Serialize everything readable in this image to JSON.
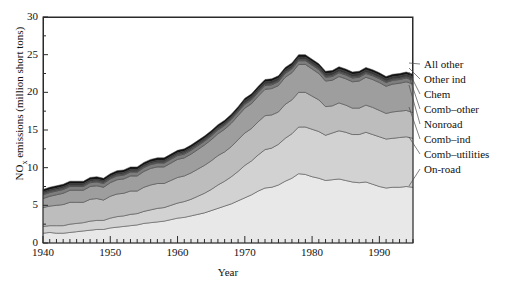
{
  "figure": {
    "xlabel": "Year",
    "ylabel_main": "NO",
    "ylabel_sub": "x",
    "ylabel_rest": " emissions (million short tons)"
  },
  "axes": {
    "y_ticks": [
      "0",
      "5",
      "10",
      "15",
      "20",
      "25",
      "30"
    ],
    "x_ticks": [
      "1940",
      "1950",
      "1960",
      "1970",
      "1980",
      "1990"
    ]
  },
  "legend": {
    "items": [
      {
        "label": "All other"
      },
      {
        "label": "Other ind"
      },
      {
        "label": "Chem"
      },
      {
        "label": "Comb–other"
      },
      {
        "label": "Nonroad"
      },
      {
        "label": "Comb–ind"
      },
      {
        "label": "Comb–utilities"
      },
      {
        "label": "On-road"
      }
    ]
  },
  "chart_data": {
    "type": "area",
    "title": "",
    "xlabel": "Year",
    "ylabel": "NOx emissions (million short tons)",
    "xlim": [
      1940,
      1995
    ],
    "ylim": [
      0,
      30
    ],
    "grid": false,
    "stacked": true,
    "legend_position": "right-outside-leader-lines",
    "x": [
      1940,
      1941,
      1942,
      1943,
      1944,
      1945,
      1946,
      1947,
      1948,
      1949,
      1950,
      1951,
      1952,
      1953,
      1954,
      1955,
      1956,
      1957,
      1958,
      1959,
      1960,
      1961,
      1962,
      1963,
      1964,
      1965,
      1966,
      1967,
      1968,
      1969,
      1970,
      1971,
      1972,
      1973,
      1974,
      1975,
      1976,
      1977,
      1978,
      1979,
      1980,
      1981,
      1982,
      1983,
      1984,
      1985,
      1986,
      1987,
      1988,
      1989,
      1990,
      1991,
      1992,
      1993,
      1994,
      1995
    ],
    "series": [
      {
        "name": "On-road",
        "color": "#e8e8e8",
        "values": [
          1.3,
          1.4,
          1.3,
          1.3,
          1.4,
          1.5,
          1.6,
          1.7,
          1.8,
          1.8,
          2.0,
          2.1,
          2.2,
          2.3,
          2.4,
          2.6,
          2.7,
          2.8,
          2.9,
          3.1,
          3.3,
          3.4,
          3.6,
          3.8,
          4.0,
          4.3,
          4.6,
          4.9,
          5.2,
          5.6,
          6.0,
          6.4,
          6.9,
          7.3,
          7.4,
          7.7,
          8.2,
          8.6,
          9.2,
          9.1,
          8.8,
          8.6,
          8.3,
          8.4,
          8.5,
          8.3,
          8.1,
          8.0,
          8.1,
          7.8,
          7.5,
          7.3,
          7.4,
          7.4,
          7.5,
          7.4
        ]
      },
      {
        "name": "Comb–utilities",
        "color": "#d2d2d2",
        "values": [
          0.9,
          0.9,
          1.0,
          1.0,
          1.1,
          1.1,
          1.1,
          1.2,
          1.2,
          1.2,
          1.3,
          1.4,
          1.4,
          1.5,
          1.5,
          1.6,
          1.7,
          1.8,
          1.8,
          1.9,
          2.0,
          2.1,
          2.2,
          2.4,
          2.6,
          2.8,
          3.1,
          3.3,
          3.6,
          3.9,
          4.3,
          4.5,
          4.8,
          5.1,
          5.2,
          5.4,
          5.7,
          5.9,
          6.2,
          6.3,
          6.3,
          6.2,
          6.0,
          6.2,
          6.4,
          6.4,
          6.3,
          6.4,
          6.6,
          6.6,
          6.6,
          6.5,
          6.5,
          6.6,
          6.6,
          6.5
        ]
      },
      {
        "name": "Comb–ind",
        "color": "#bdbdbd",
        "values": [
          2.5,
          2.6,
          2.7,
          2.8,
          2.9,
          2.8,
          2.7,
          2.9,
          2.9,
          2.7,
          2.9,
          3.0,
          3.0,
          3.1,
          3.0,
          3.2,
          3.3,
          3.3,
          3.2,
          3.3,
          3.4,
          3.4,
          3.5,
          3.6,
          3.7,
          3.8,
          3.9,
          3.9,
          4.0,
          4.2,
          4.3,
          4.3,
          4.4,
          4.5,
          4.4,
          4.3,
          4.5,
          4.5,
          4.6,
          4.6,
          4.4,
          4.2,
          3.8,
          3.6,
          3.7,
          3.6,
          3.5,
          3.5,
          3.6,
          3.6,
          3.5,
          3.4,
          3.5,
          3.5,
          3.5,
          3.4
        ]
      },
      {
        "name": "Nonroad",
        "color": "#9e9e9e",
        "values": [
          1.2,
          1.3,
          1.4,
          1.5,
          1.6,
          1.6,
          1.6,
          1.7,
          1.7,
          1.7,
          1.8,
          1.9,
          1.9,
          2.0,
          2.0,
          2.1,
          2.2,
          2.2,
          2.2,
          2.3,
          2.4,
          2.4,
          2.5,
          2.6,
          2.7,
          2.8,
          2.9,
          3.0,
          3.1,
          3.2,
          3.3,
          3.3,
          3.4,
          3.5,
          3.5,
          3.5,
          3.6,
          3.6,
          3.7,
          3.7,
          3.6,
          3.5,
          3.4,
          3.4,
          3.5,
          3.5,
          3.5,
          3.6,
          3.7,
          3.7,
          3.7,
          3.6,
          3.7,
          3.7,
          3.8,
          3.8
        ]
      },
      {
        "name": "Comb–other",
        "color": "#7d7d7d",
        "values": [
          0.5,
          0.5,
          0.5,
          0.5,
          0.5,
          0.5,
          0.5,
          0.5,
          0.5,
          0.5,
          0.5,
          0.5,
          0.5,
          0.5,
          0.5,
          0.5,
          0.5,
          0.5,
          0.5,
          0.5,
          0.5,
          0.5,
          0.5,
          0.5,
          0.5,
          0.5,
          0.5,
          0.5,
          0.5,
          0.5,
          0.5,
          0.5,
          0.5,
          0.5,
          0.5,
          0.5,
          0.5,
          0.5,
          0.5,
          0.5,
          0.5,
          0.5,
          0.5,
          0.5,
          0.5,
          0.5,
          0.5,
          0.5,
          0.5,
          0.5,
          0.5,
          0.5,
          0.5,
          0.5,
          0.5,
          0.5
        ]
      },
      {
        "name": "Chem",
        "color": "#5a5a5a",
        "values": [
          0.2,
          0.2,
          0.2,
          0.2,
          0.2,
          0.2,
          0.2,
          0.2,
          0.2,
          0.2,
          0.2,
          0.2,
          0.2,
          0.2,
          0.2,
          0.2,
          0.2,
          0.2,
          0.2,
          0.2,
          0.2,
          0.2,
          0.2,
          0.2,
          0.2,
          0.2,
          0.2,
          0.2,
          0.2,
          0.2,
          0.2,
          0.2,
          0.2,
          0.2,
          0.2,
          0.2,
          0.2,
          0.2,
          0.2,
          0.2,
          0.2,
          0.2,
          0.2,
          0.2,
          0.2,
          0.2,
          0.2,
          0.2,
          0.2,
          0.2,
          0.2,
          0.2,
          0.2,
          0.2,
          0.2,
          0.2
        ]
      },
      {
        "name": "Other ind",
        "color": "#3a3a3a",
        "values": [
          0.2,
          0.2,
          0.2,
          0.2,
          0.2,
          0.2,
          0.2,
          0.2,
          0.2,
          0.2,
          0.2,
          0.2,
          0.2,
          0.2,
          0.2,
          0.2,
          0.2,
          0.2,
          0.2,
          0.2,
          0.2,
          0.2,
          0.2,
          0.2,
          0.2,
          0.2,
          0.2,
          0.2,
          0.2,
          0.2,
          0.3,
          0.3,
          0.3,
          0.3,
          0.3,
          0.3,
          0.3,
          0.3,
          0.3,
          0.3,
          0.3,
          0.3,
          0.3,
          0.3,
          0.3,
          0.3,
          0.3,
          0.3,
          0.3,
          0.3,
          0.3,
          0.3,
          0.3,
          0.3,
          0.3,
          0.3
        ]
      },
      {
        "name": "All other",
        "color": "#111111",
        "values": [
          0.3,
          0.3,
          0.3,
          0.3,
          0.3,
          0.3,
          0.3,
          0.3,
          0.3,
          0.3,
          0.3,
          0.3,
          0.3,
          0.3,
          0.3,
          0.3,
          0.3,
          0.3,
          0.3,
          0.3,
          0.3,
          0.3,
          0.3,
          0.3,
          0.3,
          0.3,
          0.3,
          0.3,
          0.3,
          0.3,
          0.3,
          0.3,
          0.3,
          0.3,
          0.3,
          0.3,
          0.3,
          0.3,
          0.3,
          0.3,
          0.3,
          0.3,
          0.3,
          0.3,
          0.3,
          0.3,
          0.3,
          0.3,
          0.3,
          0.3,
          0.3,
          0.3,
          0.3,
          0.3,
          0.3,
          0.3
        ]
      }
    ]
  }
}
